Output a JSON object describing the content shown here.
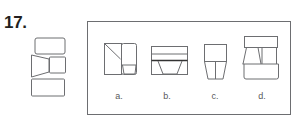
{
  "question": {
    "number": "17."
  },
  "reference_figure": {
    "description": "Unfolded net: rounded rectangle on top, trapezoid on left, small square on right, rectangle on bottom"
  },
  "options": [
    {
      "id": "a",
      "label": "a."
    },
    {
      "id": "b",
      "label": "b."
    },
    {
      "id": "c",
      "label": "c."
    },
    {
      "id": "d",
      "label": "d."
    }
  ],
  "colors": {
    "stroke": "#6d6e71",
    "text": "#231f20",
    "label": "#58595b"
  }
}
